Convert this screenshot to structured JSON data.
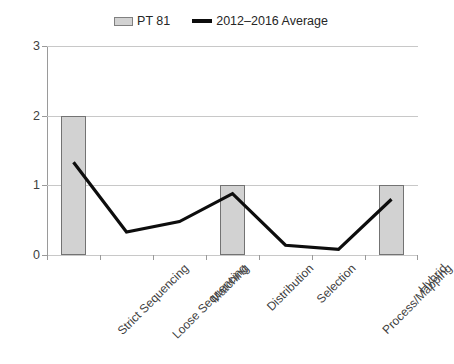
{
  "chart_data": {
    "type": "bar",
    "title": "",
    "subtitle": "",
    "xlabel": "",
    "ylabel": "",
    "ylim": [
      0,
      3
    ],
    "yticks": [
      "0",
      "1",
      "2",
      "3"
    ],
    "grid": true,
    "legend_position": "top-center",
    "categories": [
      "Strict Sequencing",
      "Loose Sequencing",
      "Matching",
      "Distribution",
      "Selection",
      "Process/Mapping",
      "Hybrid"
    ],
    "series": [
      {
        "name": "PT 81",
        "type": "bar",
        "color": "#d2d2d2",
        "border_color": "#737373",
        "values": [
          2,
          0,
          0,
          1,
          0,
          0,
          1
        ]
      },
      {
        "name": "2012–2016 Average",
        "type": "line",
        "color": "#0d0d0d",
        "values": [
          1.33,
          0.33,
          0.48,
          0.88,
          0.14,
          0.08,
          0.8
        ]
      }
    ]
  },
  "legend": {
    "entries": [
      {
        "label": "PT 81",
        "marker": "bar-swatch"
      },
      {
        "label": "2012–2016 Average",
        "marker": "line-swatch"
      }
    ]
  },
  "axes": {
    "y": {
      "ticks": [
        "0",
        "1",
        "2",
        "3"
      ],
      "min": 0,
      "max": 3
    },
    "x": {
      "ticks": [
        "Strict Sequencing",
        "Loose Sequencing",
        "Matching",
        "Distribution",
        "Selection",
        "Process/Mapping",
        "Hybrid"
      ]
    }
  },
  "colors": {
    "bar_fill": "#d2d2d2",
    "bar_border": "#737373",
    "line": "#0d0d0d",
    "gridline": "#c8c8c8",
    "axis": "#9a9a9a",
    "text": "#404040",
    "background": "#ffffff"
  }
}
